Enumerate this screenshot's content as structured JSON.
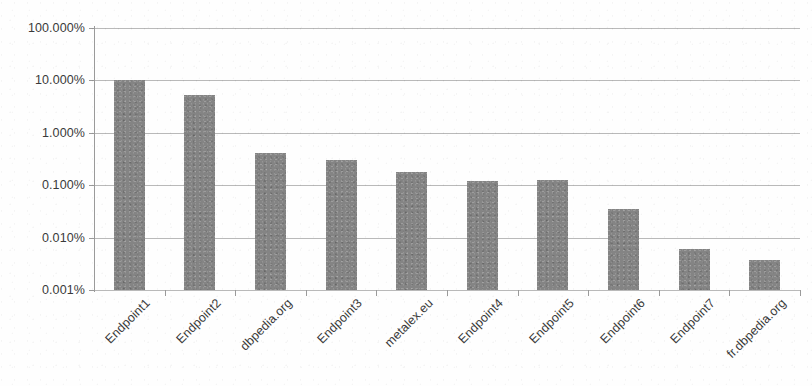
{
  "chart_data": {
    "type": "bar",
    "title": "",
    "subtitle": "",
    "xlabel": "",
    "ylabel": "",
    "yscale": "log",
    "ylim": [
      0.001,
      100
    ],
    "ytick_labels": [
      "100.000%",
      "10.000%",
      "1.000%",
      "0.100%",
      "0.010%",
      "0.001%"
    ],
    "ytick_values": [
      100,
      10,
      1,
      0.1,
      0.01,
      0.001
    ],
    "grid": true,
    "legend": "none",
    "series_name": "",
    "bar_color": "#848484",
    "categories": [
      "Endpoint1",
      "Endpoint2",
      "dbpedia.org",
      "Endpoint3",
      "metalex.eu",
      "Endpoint4",
      "Endpoint5",
      "Endpoint6",
      "Endpoint7",
      "fr.dbpedia.org"
    ],
    "values": [
      10.0,
      5.3,
      0.42,
      0.3,
      0.18,
      0.12,
      0.125,
      0.035,
      0.006,
      0.0038
    ],
    "value_labels": [
      "10.000%",
      "5.300%",
      "0.420%",
      "0.300%",
      "0.180%",
      "0.120%",
      "0.125%",
      "0.035%",
      "0.006%",
      "0.004%"
    ]
  },
  "axes": {
    "y_axis_name": "value-axis",
    "x_axis_name": "category-axis"
  }
}
